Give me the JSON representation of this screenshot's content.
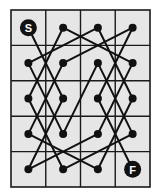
{
  "diagram": {
    "type": "knight-tour-puzzle",
    "grid": {
      "cols": 4,
      "rows": 5,
      "x": 11,
      "y": 10,
      "width": 139,
      "height": 177,
      "background": "#e6e6e6",
      "line_color": "#1a1a1a"
    },
    "start": {
      "label": "S",
      "col": 0,
      "row": 0
    },
    "finish": {
      "label": "F",
      "col": 3,
      "row": 4
    },
    "path": [
      [
        0,
        0
      ],
      [
        1,
        2
      ],
      [
        0,
        4
      ],
      [
        2,
        3
      ],
      [
        3,
        1
      ],
      [
        1,
        0
      ],
      [
        0,
        2
      ],
      [
        1,
        4
      ],
      [
        3,
        3
      ],
      [
        2,
        1
      ],
      [
        1,
        3
      ],
      [
        0,
        1
      ],
      [
        2,
        0
      ],
      [
        3,
        2
      ],
      [
        2,
        4
      ],
      [
        0,
        3
      ],
      [
        1,
        1
      ],
      [
        3,
        0
      ],
      [
        2,
        2
      ],
      [
        3,
        4
      ]
    ],
    "colors": {
      "node": "#111111",
      "edge": "#111111",
      "label": "#ffffff"
    }
  }
}
